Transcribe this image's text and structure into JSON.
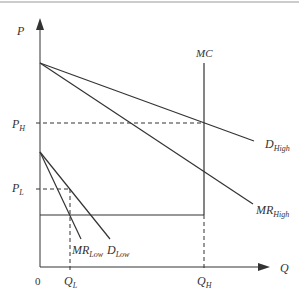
{
  "diagram": {
    "type": "price-discrimination",
    "colors": {
      "line": "#333333",
      "background": "#ffffff",
      "top_rule": "#999999"
    },
    "axes": {
      "y_label": "P",
      "x_label": "Q",
      "origin_label": "0"
    },
    "price_labels": {
      "high": {
        "base": "P",
        "sub": "H"
      },
      "low": {
        "base": "P",
        "sub": "L"
      }
    },
    "quantity_labels": {
      "low": {
        "base": "Q",
        "sub": "L"
      },
      "high": {
        "base": "Q",
        "sub": "H"
      }
    },
    "curves": {
      "mc": {
        "label": "MC"
      },
      "d_high": {
        "base": "D",
        "sub": "High"
      },
      "mr_high": {
        "base": "MR",
        "sub": "High"
      },
      "d_low": {
        "base": "D",
        "sub": "Low"
      },
      "mr_low": {
        "base": "MR",
        "sub": "Low"
      }
    }
  }
}
